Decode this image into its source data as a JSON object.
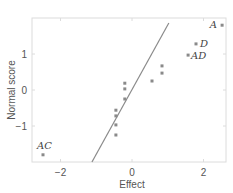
{
  "chart_data": {
    "type": "scatter",
    "title": "",
    "xlabel": "Effect",
    "ylabel": "Normal score",
    "xlim": [
      -2.78,
      2.65
    ],
    "ylim": [
      -2.0,
      2.0
    ],
    "xticks": [
      -2,
      0,
      2
    ],
    "yticks": [
      -1,
      0,
      1
    ],
    "grid": false,
    "legend": null,
    "points": [
      {
        "x": 2.52,
        "y": 1.8,
        "label": "A"
      },
      {
        "x": 1.79,
        "y": 1.28,
        "label": "D"
      },
      {
        "x": 1.57,
        "y": 0.97,
        "label": "AD"
      },
      {
        "x": 0.84,
        "y": 0.67,
        "label": ""
      },
      {
        "x": 0.84,
        "y": 0.47,
        "label": ""
      },
      {
        "x": 0.56,
        "y": 0.25,
        "label": ""
      },
      {
        "x": -0.2,
        "y": 0.19,
        "label": ""
      },
      {
        "x": -0.2,
        "y": 0.03,
        "label": ""
      },
      {
        "x": -0.2,
        "y": -0.25,
        "label": ""
      },
      {
        "x": -0.45,
        "y": -0.56,
        "label": ""
      },
      {
        "x": -0.45,
        "y": -0.72,
        "label": ""
      },
      {
        "x": -0.45,
        "y": -0.97,
        "label": ""
      },
      {
        "x": -0.45,
        "y": -1.25,
        "label": ""
      },
      {
        "x": -2.49,
        "y": -1.8,
        "label": "AC"
      }
    ],
    "reference_line": {
      "x1": -1.12,
      "y1": -2.0,
      "x2": 1.03,
      "y2": 1.86
    },
    "colors": {
      "point": "#8a8a8a",
      "line": "#8a8a8a",
      "frame": "#d9d9d9",
      "text": "#555555"
    }
  },
  "axes": {
    "x_title": "Effect",
    "y_title": "Normal score",
    "x_tick_labels": [
      "−2",
      "0",
      "2"
    ],
    "y_tick_labels": [
      "1",
      "0",
      "−1"
    ]
  },
  "annotations": {
    "A": "A",
    "D": "D",
    "AD": "AD",
    "AC": "AC"
  }
}
